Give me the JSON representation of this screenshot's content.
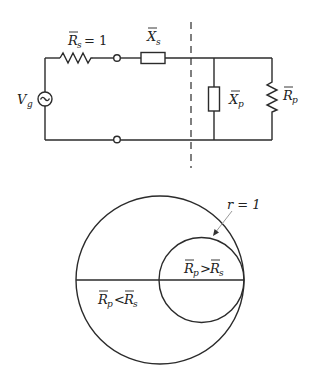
{
  "circuit": {
    "source": {
      "label": "V",
      "sub": "g",
      "icon": "ac-source-icon"
    },
    "series_resistor": {
      "label": "R",
      "sub": "s",
      "suffix": "= 1"
    },
    "series_reactance": {
      "label": "X",
      "sub": "s"
    },
    "shunt_reactance": {
      "label": "X",
      "sub": "p"
    },
    "shunt_resistor": {
      "label": "R",
      "sub": "p"
    }
  },
  "smith_chart": {
    "circle_label": "r = 1",
    "upper_region": {
      "left": "R",
      "left_sub": "p",
      "op": ">",
      "right": "R",
      "right_sub": "s"
    },
    "lower_region": {
      "left": "R",
      "left_sub": "p",
      "op": "<",
      "right": "R",
      "right_sub": "s"
    }
  },
  "colors": {
    "line": "#2b2b2b",
    "arrow": "#999999",
    "background": "#ffffff"
  }
}
